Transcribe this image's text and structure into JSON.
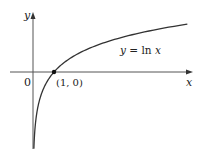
{
  "chart_data": {
    "type": "line",
    "title": "",
    "xlabel": "x",
    "ylabel": "y",
    "origin_label": "0",
    "series": [
      {
        "name": "y = ln x",
        "function": "ln(x)",
        "x": [
          0.05,
          0.1,
          0.2,
          0.3,
          0.5,
          0.75,
          1,
          1.5,
          2,
          3,
          4,
          5,
          6,
          7.3
        ],
        "values": [
          -3.0,
          -2.3,
          -1.61,
          -1.2,
          -0.69,
          -0.29,
          0,
          0.41,
          0.69,
          1.1,
          1.39,
          1.61,
          1.79,
          1.99
        ]
      }
    ],
    "annotations": [
      {
        "text": "(1, 0)",
        "x": 1,
        "y": 0,
        "marker": "dot"
      },
      {
        "text": "y = ln x",
        "position": "right of curve"
      }
    ],
    "xlim": [
      -1.1,
      7.6
    ],
    "ylim": [
      -3.0,
      2.5
    ],
    "grid": false,
    "legend": "none"
  },
  "labels": {
    "y_axis": "y",
    "x_axis": "x",
    "origin": "0",
    "point": "(1, 0)",
    "curve": "y = ln x"
  },
  "colors": {
    "axis": "#555555",
    "curve": "#333333",
    "text": "#222222"
  }
}
